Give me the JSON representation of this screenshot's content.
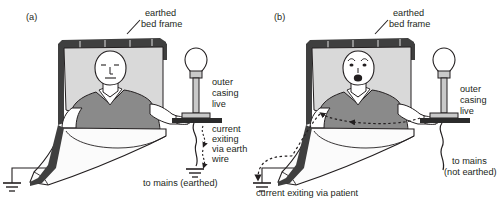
{
  "figure": {
    "type": "medical-electrical-safety-diagram",
    "background": "#ffffff",
    "ink": "#231f20",
    "colors": {
      "frame_dark": "#3f3f3f",
      "pillow": "#d9d9d9",
      "gown_gray": "#8a8a8a",
      "skin_white": "#ffffff",
      "sheet_white": "#fbfbfb",
      "lamp_gray": "#c9c9c9",
      "table_dark": "#2b2b2b"
    }
  },
  "panels": [
    {
      "id": "a",
      "tag": "(a)",
      "scenario": "earthed-appliance-safe",
      "patient_expression": "calm",
      "labels": {
        "bed_frame": "earthed\nbed frame",
        "lamp": "outer\ncasing\nlive",
        "current": "current\nexiting\nvia earth\nwire",
        "mains": "to mains (earthed)"
      }
    },
    {
      "id": "b",
      "tag": "(b)",
      "scenario": "unearthed-appliance-shock",
      "patient_expression": "shocked",
      "labels": {
        "bed_frame": "earthed\nbed frame",
        "lamp": "outer\ncasing\nlive",
        "mains": "to mains\n(not earthed)",
        "current": "current exiting via patient"
      }
    }
  ],
  "text_items": {
    "a_tag": "(a)",
    "a_bedframe_l1": "earthed",
    "a_bedframe_l2": "bed frame",
    "a_lamp_l1": "outer",
    "a_lamp_l2": "casing",
    "a_lamp_l3": "live",
    "a_current_l1": "current",
    "a_current_l2": "exiting",
    "a_current_l3": "via earth",
    "a_current_l4": "wire",
    "a_mains": "to mains (earthed)",
    "b_tag": "(b)",
    "b_bedframe_l1": "earthed",
    "b_bedframe_l2": "bed frame",
    "b_lamp_l1": "outer",
    "b_lamp_l2": "casing",
    "b_lamp_l3": "live",
    "b_mains_l1": "to mains",
    "b_mains_l2": "(not earthed)",
    "b_current": "current exiting via patient"
  }
}
